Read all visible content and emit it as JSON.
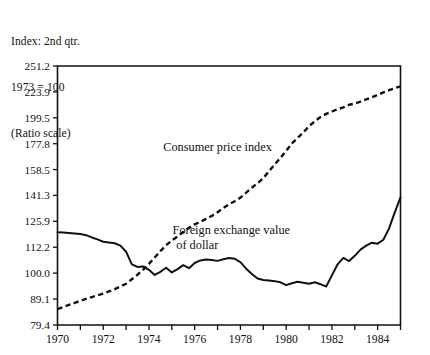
{
  "header": {
    "lines": [
      "Index: 2nd qtr.",
      "1973 = 100",
      "(Ratio scale)"
    ]
  },
  "chart_data": {
    "type": "line",
    "title": "",
    "xlabel": "",
    "ylabel": "",
    "scale": "log",
    "scale_note": "(Ratio scale)",
    "index_base": "Index: 2nd qtr. 1973 = 100",
    "grid": false,
    "legend": "inline-annotations",
    "xlim": [
      1970.0,
      1985.0
    ],
    "ylim": [
      79.4,
      251.2
    ],
    "xticks": [
      1970,
      1971,
      1972,
      1973,
      1974,
      1975,
      1976,
      1977,
      1978,
      1979,
      1980,
      1981,
      1982,
      1983,
      1984,
      1985
    ],
    "xtick_labels": [
      "1970",
      "",
      "1972",
      "",
      "1974",
      "",
      "1976",
      "",
      "1978",
      "",
      "1980",
      "",
      "1982",
      "",
      "1984",
      ""
    ],
    "yticks": [
      79.4,
      89.1,
      100.0,
      112.2,
      125.9,
      141.3,
      158.5,
      177.8,
      199.5,
      223.9,
      251.2
    ],
    "ytick_labels": [
      "79.4",
      "89.1",
      "100.0",
      "112.2",
      "125.9",
      "141.3",
      "158.5",
      "177.8",
      "199.5",
      "223.9",
      "251.2"
    ],
    "series": [
      {
        "name": "Consumer price index",
        "style": "dashed",
        "color": "#111111",
        "annotation": "Consumer price index",
        "annotation_x": 1977.0,
        "annotation_y": 172.0,
        "x": [
          1970.0,
          1970.25,
          1970.5,
          1970.75,
          1971.0,
          1971.25,
          1971.5,
          1971.75,
          1972.0,
          1972.25,
          1972.5,
          1972.75,
          1973.0,
          1973.25,
          1973.5,
          1973.75,
          1974.0,
          1974.25,
          1974.5,
          1974.75,
          1975.0,
          1975.25,
          1975.5,
          1975.75,
          1976.0,
          1976.25,
          1976.5,
          1976.75,
          1977.0,
          1977.25,
          1977.5,
          1977.75,
          1978.0,
          1978.25,
          1978.5,
          1978.75,
          1979.0,
          1979.25,
          1979.5,
          1979.75,
          1980.0,
          1980.25,
          1980.5,
          1980.75,
          1981.0,
          1981.25,
          1981.5,
          1981.75,
          1982.0,
          1982.25,
          1982.5,
          1982.75,
          1983.0,
          1983.25,
          1983.5,
          1983.75,
          1984.0,
          1984.25,
          1984.5,
          1984.75,
          1985.0
        ],
        "y": [
          85.2,
          86.0,
          86.8,
          87.6,
          88.4,
          89.2,
          89.9,
          90.6,
          91.3,
          92.2,
          93.1,
          94.2,
          95.4,
          97.3,
          99.3,
          101.6,
          104.2,
          107.2,
          110.3,
          113.2,
          115.6,
          117.7,
          120.1,
          122.3,
          124.2,
          125.7,
          127.3,
          129.0,
          131.1,
          133.6,
          135.8,
          137.7,
          139.9,
          143.0,
          146.2,
          149.2,
          152.6,
          157.3,
          162.2,
          167.0,
          172.3,
          178.0,
          182.4,
          187.0,
          192.2,
          196.4,
          200.2,
          203.0,
          205.2,
          207.3,
          209.0,
          211.4,
          212.6,
          214.4,
          216.6,
          218.6,
          220.8,
          223.4,
          225.6,
          227.6,
          229.5
        ]
      },
      {
        "name": "Foreign exchange value of dollar",
        "style": "solid",
        "color": "#111111",
        "annotation": "Foreign exchange value of dollar",
        "annotation_x": 1977.6,
        "annotation_y": 119.0,
        "x": [
          1970.0,
          1970.25,
          1970.5,
          1970.75,
          1971.0,
          1971.25,
          1971.5,
          1971.75,
          1972.0,
          1972.25,
          1972.5,
          1972.75,
          1973.0,
          1973.25,
          1973.5,
          1973.75,
          1974.0,
          1974.25,
          1974.5,
          1974.75,
          1975.0,
          1975.25,
          1975.5,
          1975.75,
          1976.0,
          1976.25,
          1976.5,
          1976.75,
          1977.0,
          1977.25,
          1977.5,
          1977.75,
          1978.0,
          1978.25,
          1978.5,
          1978.75,
          1979.0,
          1979.25,
          1979.5,
          1979.75,
          1980.0,
          1980.25,
          1980.5,
          1980.75,
          1981.0,
          1981.25,
          1981.5,
          1981.75,
          1982.0,
          1982.25,
          1982.5,
          1982.75,
          1983.0,
          1983.25,
          1983.5,
          1983.75,
          1984.0,
          1984.25,
          1984.5,
          1984.75,
          1985.0
        ],
        "y": [
          120.0,
          119.8,
          119.6,
          119.3,
          119.0,
          118.4,
          117.2,
          116.2,
          115.0,
          114.6,
          114.2,
          113.0,
          110.0,
          104.0,
          102.8,
          103.0,
          101.5,
          99.2,
          100.6,
          102.4,
          100.3,
          101.8,
          103.6,
          102.2,
          104.6,
          105.8,
          106.2,
          106.0,
          105.6,
          106.4,
          107.0,
          106.6,
          105.0,
          102.0,
          99.6,
          97.6,
          97.0,
          96.8,
          96.5,
          96.0,
          94.8,
          95.6,
          96.2,
          95.8,
          95.4,
          96.0,
          95.2,
          94.2,
          99.0,
          104.0,
          107.0,
          105.5,
          108.0,
          111.0,
          113.0,
          114.5,
          114.0,
          116.0,
          122.0,
          131.0,
          140.0
        ]
      }
    ]
  }
}
